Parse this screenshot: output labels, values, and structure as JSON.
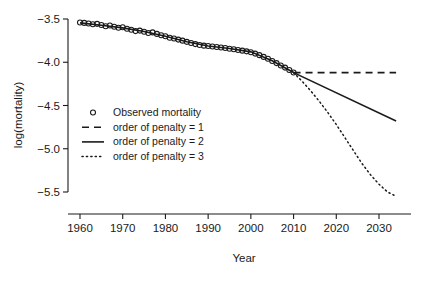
{
  "chart_data": {
    "type": "line",
    "title": "",
    "xlabel": "Year",
    "ylabel": "log(mortality)",
    "xlim": [
      1957,
      2036
    ],
    "ylim": [
      -5.62,
      -3.44
    ],
    "xticks": [
      1960,
      1970,
      1980,
      1990,
      2000,
      2010,
      2020,
      2030
    ],
    "yticks": [
      -3.5,
      -4.0,
      -4.5,
      -5.0,
      -5.5
    ],
    "ytick_labels": [
      "-3.5",
      "-4.0",
      "-4.5",
      "-5.0",
      "-5.5"
    ],
    "xtick_labels": [
      "1960",
      "1970",
      "1980",
      "1990",
      "2000",
      "2010",
      "2020",
      "2030"
    ],
    "grid": false,
    "legend_position": "center-left-inside",
    "series": [
      {
        "name": "Observed mortality",
        "style": "points",
        "marker": "open-circle",
        "color": "#1a1a1a",
        "x": [
          1960,
          1961,
          1962,
          1963,
          1964,
          1965,
          1966,
          1967,
          1968,
          1969,
          1970,
          1971,
          1972,
          1973,
          1974,
          1975,
          1976,
          1977,
          1978,
          1979,
          1980,
          1981,
          1982,
          1983,
          1984,
          1985,
          1986,
          1987,
          1988,
          1989,
          1990,
          1991,
          1992,
          1993,
          1994,
          1995,
          1996,
          1997,
          1998,
          1999,
          2000,
          2001,
          2002,
          2003,
          2004,
          2005,
          2006,
          2007,
          2008,
          2009,
          2010
        ],
        "y": [
          -3.54,
          -3.545,
          -3.552,
          -3.56,
          -3.556,
          -3.57,
          -3.583,
          -3.576,
          -3.59,
          -3.601,
          -3.596,
          -3.612,
          -3.625,
          -3.64,
          -3.634,
          -3.648,
          -3.661,
          -3.655,
          -3.672,
          -3.688,
          -3.7,
          -3.716,
          -3.726,
          -3.738,
          -3.75,
          -3.764,
          -3.778,
          -3.79,
          -3.8,
          -3.808,
          -3.812,
          -3.818,
          -3.824,
          -3.83,
          -3.836,
          -3.844,
          -3.85,
          -3.858,
          -3.866,
          -3.874,
          -3.884,
          -3.9,
          -3.918,
          -3.938,
          -3.96,
          -3.985,
          -4.01,
          -4.038,
          -4.062,
          -4.09,
          -4.118
        ]
      },
      {
        "name": "order of penalty = 1",
        "style": "dashed",
        "color": "#1a1a1a",
        "x": [
          2010,
          2034
        ],
        "y": [
          -4.12,
          -4.12
        ]
      },
      {
        "name": "order of penalty = 2",
        "style": "solid",
        "color": "#1a1a1a",
        "x": [
          2010,
          2034
        ],
        "y": [
          -4.12,
          -4.68
        ]
      },
      {
        "name": "order of penalty = 3",
        "style": "dotted",
        "color": "#1a1a1a",
        "x": [
          2010,
          2012,
          2014,
          2016,
          2018,
          2020,
          2022,
          2024,
          2026,
          2028,
          2030,
          2032,
          2034
        ],
        "y": [
          -4.12,
          -4.22,
          -4.33,
          -4.45,
          -4.58,
          -4.72,
          -4.87,
          -5.02,
          -5.17,
          -5.3,
          -5.41,
          -5.5,
          -5.55
        ]
      }
    ],
    "fit_line": {
      "name": "smooth-fit-observed",
      "style": "solid",
      "color": "#1a1a1a",
      "x": [
        1960,
        1965,
        1970,
        1975,
        1980,
        1985,
        1990,
        1995,
        2000,
        2005,
        2010
      ],
      "y": [
        -3.545,
        -3.572,
        -3.603,
        -3.645,
        -3.7,
        -3.762,
        -3.812,
        -3.842,
        -3.88,
        -3.982,
        -4.118
      ]
    }
  },
  "axis": {
    "x_title": "Year",
    "y_title": "log(mortality)"
  },
  "legend": {
    "entries": [
      {
        "label": "Observed mortality",
        "style": "open-circle"
      },
      {
        "label": "order of penalty = 1",
        "style": "dashed"
      },
      {
        "label": "order of penalty = 2",
        "style": "solid"
      },
      {
        "label": "order of penalty = 3",
        "style": "dotted"
      }
    ]
  },
  "colors": {
    "foreground": "#1a1a1a",
    "background": "#ffffff"
  }
}
